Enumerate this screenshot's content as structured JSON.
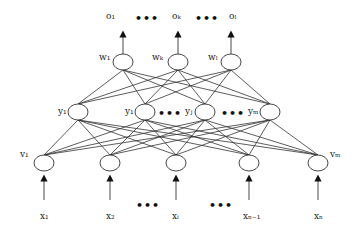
{
  "diagram": {
    "type": "neural-network",
    "colors": {
      "line": "#333333",
      "node_stroke": "#333333",
      "background": "#ffffff"
    },
    "outputs": {
      "labels": [
        "o₁",
        "oₖ",
        "oₗ"
      ],
      "ellipsis": "•••"
    },
    "output_layer": {
      "labels": [
        "w₁",
        "wₖ",
        "wₗ"
      ]
    },
    "hidden_layer": {
      "labels": [
        "y₁",
        "y₁",
        "yⱼ",
        "yₘ"
      ],
      "ellipsis": "•••"
    },
    "input_layer": {
      "labels": [
        "v₁",
        "vₘ"
      ]
    },
    "inputs": {
      "labels": [
        "x₁",
        "x₂",
        "xᵢ",
        "xₙ₋₁",
        "xₙ"
      ],
      "ellipsis": "•••"
    }
  }
}
